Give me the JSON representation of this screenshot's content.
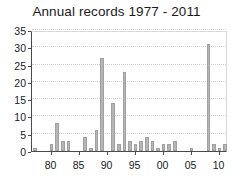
{
  "chart_data": {
    "type": "bar",
    "title": "Annual records 1977 - 2011",
    "xlabel": "",
    "ylabel": "",
    "ylim": [
      0,
      35
    ],
    "xlim": [
      1976.5,
      2011.5
    ],
    "grid": true,
    "legend": false,
    "bar_color": "#b5b5b5",
    "axis_color": "#4a4a4a",
    "grid_color": "#cfcfcf",
    "y_ticks": [
      0,
      5,
      10,
      15,
      20,
      25,
      30,
      35
    ],
    "y_tick_labels": [
      "0",
      "5",
      "10",
      "15",
      "20",
      "25",
      "30",
      "35"
    ],
    "x_ticks": [
      1980,
      1985,
      1990,
      1995,
      2000,
      2005,
      2010
    ],
    "x_tick_labels": [
      "80",
      "85",
      "90",
      "95",
      "00",
      "05",
      "10"
    ],
    "categories": [
      "1977",
      "1978",
      "1979",
      "1980",
      "1981",
      "1982",
      "1983",
      "1984",
      "1985",
      "1986",
      "1987",
      "1988",
      "1989",
      "1990",
      "1991",
      "1992",
      "1993",
      "1994",
      "1995",
      "1996",
      "1997",
      "1998",
      "1999",
      "2000",
      "2001",
      "2002",
      "2003",
      "2004",
      "2005",
      "2006",
      "2007",
      "2008",
      "2009",
      "2010",
      "2011"
    ],
    "values": [
      1,
      0,
      0,
      2,
      8,
      3,
      3,
      0,
      0,
      4,
      1,
      6,
      27,
      0,
      14,
      2,
      23,
      3,
      2,
      3,
      4,
      3,
      1,
      2,
      2,
      3,
      0,
      0,
      1,
      0,
      0,
      31,
      2,
      1,
      2
    ]
  }
}
